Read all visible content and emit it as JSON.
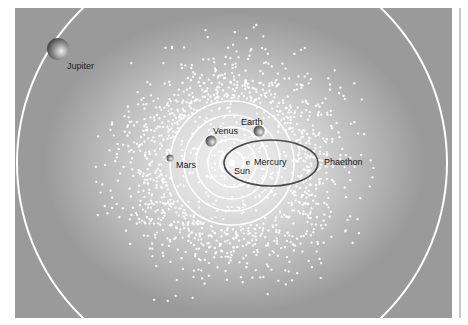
{
  "diagram": {
    "colors": {
      "background": "#ffffff",
      "field_dark": "#9a9a9a",
      "field_light": "#f2f2f2",
      "orbit_line": "#ffffff",
      "phaethon_orbit": "#4a4a4a",
      "dots": "#ffffff",
      "label_text": "#1a1a1a"
    },
    "sun": {
      "label": "Sun",
      "cx": 232,
      "cy": 163,
      "r": 4
    },
    "orbits": [
      {
        "name": "inner-orbit",
        "r": 12
      },
      {
        "name": "mercury-orbit",
        "r": 24
      },
      {
        "name": "venus-orbit",
        "r": 36
      },
      {
        "name": "earth-orbit",
        "r": 48
      },
      {
        "name": "mars-orbit",
        "r": 62
      },
      {
        "name": "jupiter-orbit",
        "r": 215
      }
    ],
    "phaethon_orbit": {
      "cx": 271,
      "cy": 163,
      "rx": 47,
      "ry": 23
    },
    "bodies": [
      {
        "name": "Jupiter",
        "cx": 58,
        "cy": 49,
        "r": 11,
        "label_x": 67,
        "label_y": 62
      },
      {
        "name": "Earth",
        "cx": 259,
        "cy": 131,
        "r": 5.5,
        "label_x": 241,
        "label_y": 118
      },
      {
        "name": "Venus",
        "cx": 211,
        "cy": 141,
        "r": 5.5,
        "label_x": 213,
        "label_y": 127
      },
      {
        "name": "Mars",
        "cx": 170,
        "cy": 158,
        "r": 3.5,
        "label_x": 176,
        "label_y": 161
      },
      {
        "name": "Mercury",
        "cx": 248,
        "cy": 163,
        "r": 2.2,
        "label_x": 254,
        "label_y": 158
      }
    ],
    "labels": {
      "jupiter": "Jupiter",
      "earth": "Earth",
      "venus": "Venus",
      "mars": "Mars",
      "mercury": "Mercury",
      "sun": "Sun",
      "phaethon": "Phaethon"
    },
    "label_positions": {
      "sun": {
        "x": 234,
        "y": 167
      },
      "phaethon": {
        "x": 324,
        "y": 158
      }
    },
    "asteroid_cloud": {
      "center_x": 233,
      "center_y": 163,
      "spread_x": 150,
      "spread_y": 140,
      "count": 2600,
      "dot_size": 2.2,
      "seed": 7
    }
  }
}
